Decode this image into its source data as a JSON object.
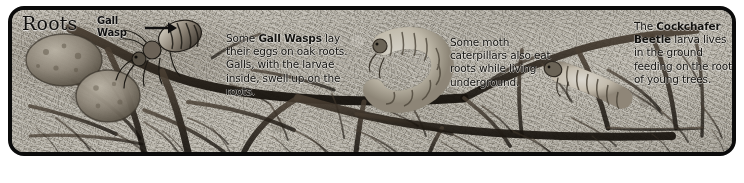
{
  "panel": {
    "title": "Roots",
    "border_color": "#0b0b0b",
    "soil_color": "#b4b0a6",
    "root_color": "#2b241c",
    "text_color": "#13120f"
  },
  "callouts": [
    {
      "name": "gall-wasp",
      "label_line1": "Gall",
      "label_line2": "Wasp",
      "arrow": "right-arrow-icon"
    }
  ],
  "text_blocks": [
    {
      "name": "gall-wasps",
      "lead": "Some ",
      "bold": "Gall Wasps",
      "rest": " lay their eggs on oak roots. Galls, with the larvae inside, swell up on the roots."
    },
    {
      "name": "moth-caterpillars",
      "lead": "",
      "bold": "",
      "rest": "Some moth caterpillars also eat roots while living underground."
    },
    {
      "name": "cockchafer-beetle",
      "lead": "The ",
      "bold": "Cockchafer Beetle",
      "rest": " larva lives in the ground feeding on the roots of young trees."
    }
  ],
  "illustrations": [
    {
      "name": "gall-lump-large",
      "kind": "oak-gall"
    },
    {
      "name": "gall-lump-small",
      "kind": "oak-gall"
    },
    {
      "name": "gall-wasp-insect",
      "kind": "wasp"
    },
    {
      "name": "moth-caterpillar-grub",
      "kind": "caterpillar"
    },
    {
      "name": "cockchafer-larva-grub",
      "kind": "grub"
    }
  ]
}
